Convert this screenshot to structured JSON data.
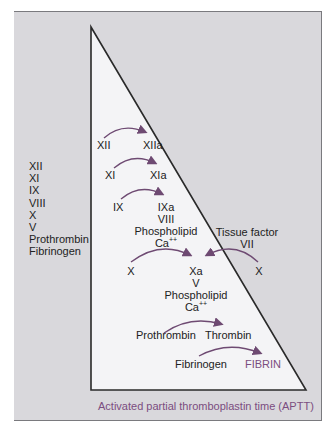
{
  "title": "Activated partial thromboplastin time (APTT)",
  "factors_tested": [
    "XII",
    "XI",
    "IX",
    "VIII",
    "X",
    "V",
    "Prothrombin",
    "Fibrinogen"
  ],
  "cascade": {
    "step1": {
      "from": "XII",
      "to": "XIIa"
    },
    "step2": {
      "from": "XI",
      "to": "XIa"
    },
    "step3": {
      "from": "IX",
      "to": "IXa",
      "cofactors": [
        "VIII",
        "Phospholipid",
        "Ca"
      ],
      "ca_charge": "++"
    },
    "extrinsic": {
      "label": "Tissue factor",
      "factor": "VII",
      "from": "X"
    },
    "step4": {
      "from": "X",
      "to": "Xa",
      "cofactors": [
        "V",
        "Phospholipid",
        "Ca"
      ],
      "ca_charge": "++"
    },
    "step5": {
      "from": "Prothrombin",
      "to": "Thrombin"
    },
    "step6": {
      "from": "Fibrinogen",
      "to": "FIBRIN"
    }
  },
  "colors": {
    "background": "#d9d8dc",
    "triangle_fill": "#f4f4f6",
    "arrow": "#6e4a72",
    "accent_text": "#7b4d80",
    "text": "#222222"
  }
}
